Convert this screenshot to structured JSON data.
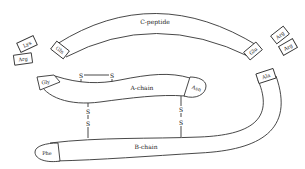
{
  "diagram": {
    "chains": {
      "c_peptide": {
        "label": "C-peptide",
        "start_residue": "Gln",
        "end_residue": "Glu"
      },
      "a_chain": {
        "label": "A-chain",
        "start_residue": "Gly",
        "end_residue": "Asn"
      },
      "b_chain": {
        "label": "B-chain",
        "start_residue": "Phe",
        "end_residue": "Ala"
      }
    },
    "linker_residues": {
      "left": [
        "Lys",
        "Arg"
      ],
      "right": [
        "Arg",
        "Arg"
      ]
    },
    "disulfide_bonds": [
      {
        "type": "intra-chain",
        "chain": "A-chain",
        "atoms": [
          "S",
          "S"
        ]
      },
      {
        "type": "inter-chain",
        "chains": [
          "A-chain",
          "B-chain"
        ],
        "atoms": [
          "S",
          "S"
        ]
      },
      {
        "type": "inter-chain",
        "chains": [
          "A-chain",
          "B-chain"
        ],
        "atoms": [
          "S",
          "S"
        ]
      }
    ],
    "sulfur_label": "S"
  }
}
